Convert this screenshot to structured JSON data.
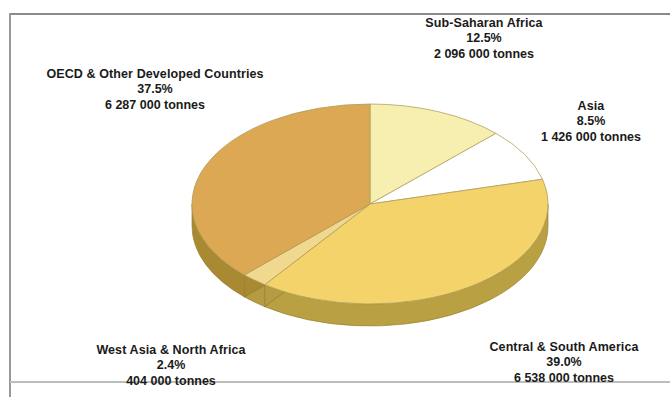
{
  "chart_data": {
    "type": "pie",
    "title": "",
    "subtitle": "",
    "xlabel": "",
    "ylabel": "",
    "unit": "tonnes",
    "legend_position": "none",
    "grid": false,
    "three_d": true,
    "start_angle_deg": 0,
    "direction": "clockwise",
    "categories": [
      "Sub-Saharan Africa",
      "Asia",
      "Central & South America",
      "West Asia & North Africa",
      "OECD & Other Developed Countries"
    ],
    "values": [
      12.5,
      8.5,
      39.0,
      2.4,
      37.5
    ],
    "value_labels": [
      "12.5%",
      "8.5%",
      "39.0%",
      "2.4%",
      "37.5%"
    ],
    "absolute_values": [
      2096000,
      1426000,
      6538000,
      404000,
      6287000
    ],
    "absolute_labels": [
      "2 096 000 tonnes",
      "1 426 000 tonnes",
      "6 538 000 tonnes",
      "404 000 tonnes",
      "6 287 000 tonnes"
    ],
    "colors": [
      "#f7efaf",
      "#ffffff",
      "#f3d36a",
      "#f0d98f",
      "#dca854"
    ],
    "slices": [
      {
        "label": "Sub-Saharan Africa",
        "percent": 12.5,
        "percent_label": "12.5%",
        "absolute_label": "2 096 000 tonnes",
        "color": "#f7efaf",
        "side_color": "#c9b45c"
      },
      {
        "label": "Asia",
        "percent": 8.5,
        "percent_label": "8.5%",
        "absolute_label": "1 426 000 tonnes",
        "color": "#ffffff",
        "side_color": "#cfc296"
      },
      {
        "label": "Central & South America",
        "percent": 39.0,
        "percent_label": "39.0%",
        "absolute_label": "6 538 000 tonnes",
        "color": "#f3d36a",
        "side_color": "#b9a043"
      },
      {
        "label": "West Asia & North Africa",
        "percent": 2.4,
        "percent_label": "2.4%",
        "absolute_label": "404 000 tonnes",
        "color": "#f0d98f",
        "side_color": "#b59c42"
      },
      {
        "label": "OECD & Other Developed Countries",
        "percent": 37.5,
        "percent_label": "37.5%",
        "absolute_label": "6 287 000 tonnes",
        "color": "#dca854",
        "side_color": "#a98a33"
      }
    ]
  },
  "labels": {
    "sub_saharan_africa": {
      "name": "Sub-Saharan Africa",
      "percent": "12.5%",
      "value": "2 096 000 tonnes"
    },
    "oecd": {
      "name": "OECD & Other Developed Countries",
      "percent": "37.5%",
      "value": "6 287 000 tonnes"
    },
    "asia": {
      "name": "Asia",
      "percent": "8.5%",
      "value": "1 426 000 tonnes"
    },
    "west_asia_north_africa": {
      "name": "West Asia & North Africa",
      "percent": "2.4%",
      "value": "404 000 tonnes"
    },
    "central_south_america": {
      "name": "Central & South America",
      "percent": "39.0%",
      "value": "6 538 000 tonnes"
    }
  },
  "geometry": {
    "cx": 370,
    "cy": 204,
    "rx": 178,
    "ry": 100,
    "depth": 22
  }
}
